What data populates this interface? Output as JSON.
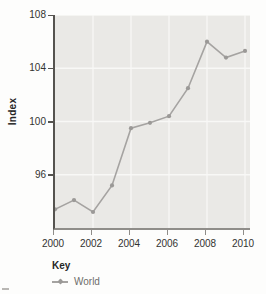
{
  "chart": {
    "y_axis_label": "Index",
    "y_ticks": [
      108,
      104,
      100,
      96
    ],
    "x_ticks": [
      2000,
      2002,
      2004,
      2006,
      2008,
      2010
    ],
    "legend": {
      "title": "Key",
      "series_label": "World"
    },
    "colors": {
      "page_bg": "#fdfdfc",
      "plot_bg": "#eae9e6",
      "grid": "#f8f8f6",
      "line": "#a5a3a1",
      "marker": "#9b9997",
      "y_axis": "#55534f",
      "x_axis": "#8f8d89",
      "tick_text": "#333330",
      "legend_text": "#6f6d6b"
    }
  },
  "chart_data": {
    "type": "line",
    "title": "",
    "xlabel": "",
    "ylabel": "Index",
    "x": [
      2000,
      2001,
      2002,
      2003,
      2004,
      2005,
      2006,
      2007,
      2008,
      2009,
      2010
    ],
    "series": [
      {
        "name": "World",
        "values": [
          93.4,
          94.1,
          93.2,
          95.2,
          99.5,
          99.9,
          100.4,
          102.5,
          106.0,
          104.8,
          105.3
        ]
      }
    ],
    "xlim": [
      2000,
      2010
    ],
    "ylim": [
      92,
      108
    ],
    "grid": true,
    "legend_position": "bottom-left"
  }
}
